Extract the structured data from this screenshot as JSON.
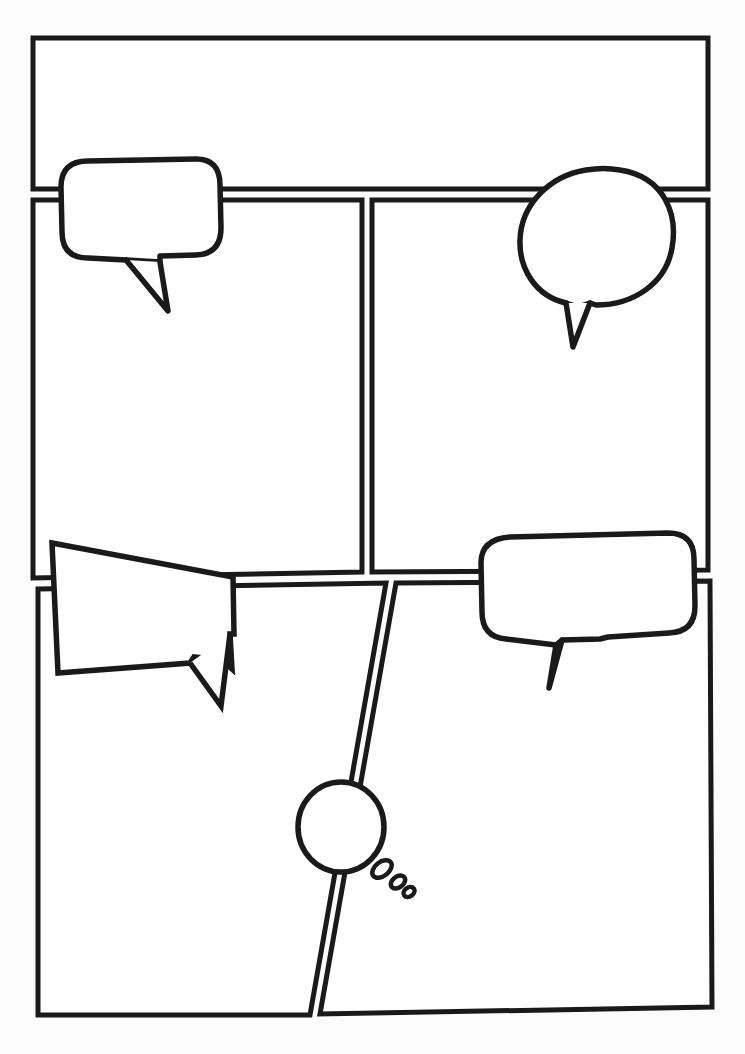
{
  "page": {
    "kind": "comic-page-template",
    "width": 745,
    "height": 1054,
    "background_color": "#fdfdfd",
    "ink_color": "#1a1a1a",
    "panel_fill": "#ffffff",
    "text_content": ""
  },
  "panels": [
    {
      "id": "panel-1",
      "name": "top-wide-panel",
      "row": 1,
      "label": "",
      "points": "33,38 708,38 708,189 33,189",
      "caption": ""
    },
    {
      "id": "panel-2",
      "name": "middle-left-panel",
      "row": 2,
      "label": "",
      "points": "33,200 362,200 362,572 33,578",
      "caption": ""
    },
    {
      "id": "panel-3",
      "name": "middle-right-panel",
      "row": 2,
      "label": "",
      "points": "372,200 708,200 708,570 372,572",
      "caption": ""
    },
    {
      "id": "panel-4",
      "name": "bottom-left-panel",
      "row": 3,
      "label": "",
      "points": "38,589 386,583 310,1015 38,1015",
      "caption": ""
    },
    {
      "id": "panel-5",
      "name": "bottom-right-panel",
      "row": 3,
      "label": "",
      "points": "396,583 710,581 712,1007 320,1014",
      "caption": ""
    }
  ],
  "bubbles": [
    {
      "id": "bubble-1",
      "name": "speech-bubble-rounded-top-left",
      "type": "speech",
      "shape": "rounded-rect",
      "tail_direction": "down",
      "body_path": "M 88,161 L 196,159 Q 220,159 220,185 L 221,228 Q 221,254 196,255 L 160,256 L 160,262 L 126,260 L 88,258 Q 62,258 62,232 L 61,187 Q 61,161 88,161 Z",
      "tail_path": "M 126,260 L 168,311 L 160,262",
      "text": ""
    },
    {
      "id": "bubble-2",
      "name": "speech-bubble-oval-top-right",
      "type": "speech",
      "shape": "ellipse",
      "tail_direction": "down-left",
      "body_path": "M 620,170 C 665,177 678,215 672,248 C 666,283 634,305 596,305 L 590,303 L 578,307 L 566,303 C 535,296 519,268 520,240 C 521,205 549,176 586,170 C 597,168 610,168 620,170 Z",
      "tail_path": "M 590,303 L 573,347 L 566,303",
      "text": ""
    },
    {
      "id": "bubble-3",
      "name": "speech-bubble-angular-bottom-left",
      "type": "shout",
      "shape": "trapezoid",
      "tail_direction": "down-right",
      "body_path": "M 52,543 L 233,577 L 234,634 L 230,634 L 232,669 L 222,660 L 194,657 L 190,663 L 58,673 Z",
      "tail_path": "M 190,663 L 221,706 L 230,634",
      "text": ""
    },
    {
      "id": "bubble-4",
      "name": "speech-bubble-rounded-bottom-right",
      "type": "speech",
      "shape": "rounded-rect",
      "tail_direction": "down",
      "body_path": "M 510,537 L 668,533 Q 694,533 694,559 L 695,606 Q 695,632 669,633 L 608,637 L 600,639 L 562,640 L 556,645 L 506,639 Q 482,637 482,612 L 481,563 Q 481,539 510,537 Z",
      "tail_path": "M 556,645 L 549,688 L 562,640",
      "text": ""
    },
    {
      "id": "bubble-5",
      "name": "thought-bubble-bottom-center",
      "type": "thought",
      "shape": "circle",
      "tail_direction": "down-right",
      "body_cx": 341,
      "body_cy": 827,
      "body_rx": 43,
      "body_ry": 45,
      "dots": [
        {
          "cx": 382,
          "cy": 869,
          "rx": 11,
          "ry": 7,
          "rot": -38
        },
        {
          "cx": 398,
          "cy": 882,
          "rx": 8,
          "ry": 5.5,
          "rot": -38
        },
        {
          "cx": 409,
          "cy": 892,
          "rx": 6,
          "ry": 4.5,
          "rot": -38
        }
      ],
      "text": ""
    }
  ],
  "gutters": {
    "row1_row2_y": 195,
    "row2_row3_y": 578,
    "col_gutter_x": 367,
    "gutter_width": 10
  }
}
